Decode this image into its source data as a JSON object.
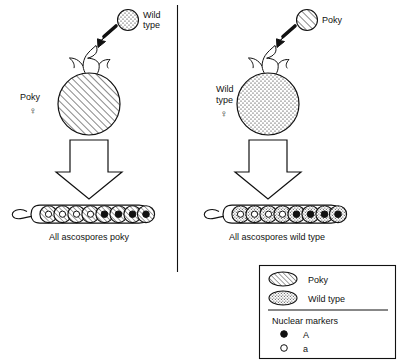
{
  "figure": {
    "divider": "vertical-divider"
  },
  "panels": [
    {
      "id": "left",
      "parent_female": {
        "label_lines": [
          "Poky"
        ],
        "sex_symbol": "♀",
        "fill_style": "hatched",
        "phenotype": "Poky"
      },
      "parent_male": {
        "label_lines": [
          "Wild",
          "type"
        ],
        "fill_style": "stippled",
        "phenotype": "Wild type"
      },
      "arrow_name": "fertilization-arrow",
      "result_arrow_name": "meiosis-arrow",
      "ascus": {
        "spore_count": 8,
        "spore_fill": "hatched",
        "nuclear_markers": [
          "a",
          "a",
          "a",
          "a",
          "A",
          "A",
          "A",
          "A"
        ]
      },
      "caption": "All ascospores poky"
    },
    {
      "id": "right",
      "parent_female": {
        "label_lines": [
          "Wild",
          "type"
        ],
        "sex_symbol": "♀",
        "fill_style": "stippled",
        "phenotype": "Wild type"
      },
      "parent_male": {
        "label_lines": [
          "Poky"
        ],
        "fill_style": "hatched",
        "phenotype": "Poky"
      },
      "arrow_name": "fertilization-arrow",
      "result_arrow_name": "meiosis-arrow",
      "ascus": {
        "spore_count": 8,
        "spore_fill": "stippled",
        "nuclear_markers": [
          "a",
          "a",
          "a",
          "a",
          "A",
          "A",
          "A",
          "A"
        ]
      },
      "caption": "All ascospores wild type"
    }
  ],
  "legend": {
    "entries": [
      {
        "swatch": "hatched",
        "label": "Poky"
      },
      {
        "swatch": "stippled",
        "label": "Wild type"
      }
    ],
    "markers_title": "Nuclear markers",
    "markers": [
      {
        "swatch": "filled-dot",
        "label": "A"
      },
      {
        "swatch": "open-dot",
        "label": "a"
      }
    ]
  },
  "colors": {
    "ink": "#111111",
    "paper": "#ffffff"
  }
}
